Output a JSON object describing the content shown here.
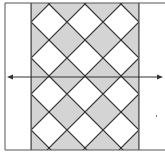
{
  "diagram": {
    "type": "tessellation",
    "colors": {
      "background": "#ffffff",
      "band_fill": "#d4d4d4",
      "tile_fill": "#ffffff",
      "line": "#333333",
      "frame": "#555555"
    },
    "frame": {
      "x": 5,
      "y": 3,
      "width": 158,
      "height": 147
    },
    "band": {
      "x": 31,
      "y": 3,
      "width": 108,
      "height": 147
    },
    "lattice": {
      "tile_half_size": 18,
      "period": 36,
      "white_tile_centers_x": [
        49,
        85,
        121
      ],
      "white_tile_centers_y": [
        22,
        58,
        94,
        130
      ]
    },
    "arrow": {
      "y": 77,
      "x_start": 7,
      "x_end": 163,
      "double_headed": true
    },
    "marks": [
      {
        "type": "dot",
        "x": 156,
        "y": 116
      }
    ]
  }
}
